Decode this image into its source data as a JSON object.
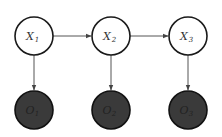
{
  "diagram": {
    "type": "hidden-markov-model",
    "colors": {
      "hidden_fill": "#ffffff",
      "observed_fill": "#3a3a3a",
      "stroke": "#1a1a1a",
      "edge": "#555555",
      "hidden_text": "#333333",
      "observed_text": "#222222"
    },
    "hidden_nodes": [
      {
        "id": "X1",
        "base": "X",
        "sub": "1",
        "cx": 34,
        "cy": 36
      },
      {
        "id": "X2",
        "base": "X",
        "sub": "2",
        "cx": 111,
        "cy": 36
      },
      {
        "id": "X3",
        "base": "X",
        "sub": "3",
        "cx": 188,
        "cy": 36
      }
    ],
    "observed_nodes": [
      {
        "id": "O1",
        "base": "O",
        "sub": "1",
        "cx": 34,
        "cy": 110
      },
      {
        "id": "O2",
        "base": "O",
        "sub": "2",
        "cx": 111,
        "cy": 110
      },
      {
        "id": "O3",
        "base": "O",
        "sub": "3",
        "cx": 188,
        "cy": 110
      }
    ],
    "edges": [
      {
        "from": "X1",
        "to": "X2"
      },
      {
        "from": "X2",
        "to": "X3"
      },
      {
        "from": "X1",
        "to": "O1"
      },
      {
        "from": "X2",
        "to": "O2"
      },
      {
        "from": "X3",
        "to": "O3"
      }
    ]
  }
}
